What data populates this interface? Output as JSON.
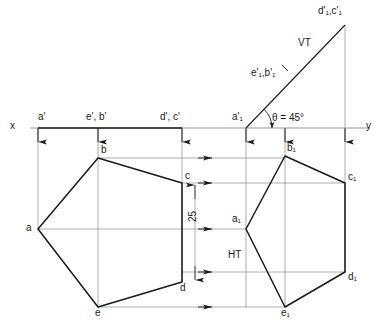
{
  "figure": {
    "type": "engineering-drawing",
    "line_color": "#1a1a1a",
    "thin_line_color": "#8a8a8a",
    "background": "#ffffff"
  },
  "axis": {
    "x_label": "x",
    "y_label": "y",
    "xy_line_y": 128,
    "x_start": 30,
    "x_end": 370
  },
  "front_view_labels": [
    {
      "id": "a-prime",
      "text": "a'",
      "x": 38,
      "y": 112
    },
    {
      "id": "e-b-prime",
      "text": "e', b'",
      "x": 86,
      "y": 112
    },
    {
      "id": "d-c-prime",
      "text": "d', c'",
      "x": 160,
      "y": 112
    },
    {
      "id": "a1-prime",
      "text": "a'₁",
      "x": 232,
      "y": 112
    }
  ],
  "tilted_view_labels": [
    {
      "id": "d1-c1-prime",
      "text": "d'₁,c'₁",
      "x": 318,
      "y": 6
    },
    {
      "id": "e1-b1-prime",
      "text": "e'₁,b'₁",
      "x": 251,
      "y": 68
    },
    {
      "id": "vt-label",
      "text": "VT",
      "x": 298,
      "y": 38
    },
    {
      "id": "angle-label",
      "text": "θ = 45°",
      "x": 272,
      "y": 113
    }
  ],
  "top_view_left": {
    "name": "pentagon-top-view-original",
    "vertices": [
      {
        "id": "a",
        "label": "a",
        "x": 38,
        "y": 229,
        "label_x": 26,
        "label_y": 223
      },
      {
        "id": "b",
        "label": "b",
        "x": 98,
        "y": 158,
        "label_x": 101,
        "label_y": 145
      },
      {
        "id": "c",
        "label": "c",
        "x": 182,
        "y": 183,
        "label_x": 185,
        "label_y": 171
      },
      {
        "id": "d",
        "label": "d",
        "x": 182,
        "y": 282,
        "label_x": 180,
        "label_y": 283
      },
      {
        "id": "e",
        "label": "e",
        "x": 98,
        "y": 307,
        "label_x": 95,
        "label_y": 308
      }
    ]
  },
  "top_view_right": {
    "name": "pentagon-top-view-rotated",
    "vertices": [
      {
        "id": "a1",
        "label": "a₁",
        "x": 246,
        "y": 229,
        "label_x": 232,
        "label_y": 214
      },
      {
        "id": "b1",
        "label": "b₁",
        "x": 285,
        "y": 156,
        "label_x": 287,
        "label_y": 143
      },
      {
        "id": "c1",
        "label": "c₁",
        "x": 345,
        "y": 183,
        "label_x": 348,
        "label_y": 172
      },
      {
        "id": "d1",
        "label": "d₁",
        "x": 345,
        "y": 272,
        "label_x": 348,
        "label_y": 272
      },
      {
        "id": "e1",
        "label": "e₁",
        "x": 285,
        "y": 307,
        "label_x": 281,
        "label_y": 308
      }
    ]
  },
  "dimension": {
    "name": "height-dimension",
    "value": "25",
    "x": 195,
    "y_top": 183,
    "y_bottom": 282,
    "label_x": 188,
    "label_y": 222
  },
  "trace_labels": {
    "ht": {
      "text": "HT",
      "x": 228,
      "y": 250
    },
    "vt": {
      "text": "VT"
    }
  },
  "vt_line": {
    "name": "vertical-trace-line",
    "x1": 246,
    "y1": 128,
    "x2": 345,
    "y2": 25,
    "angle_deg": 45,
    "intersection_point": {
      "x": 285,
      "y": 68
    }
  },
  "projector_verticals": [
    {
      "id": "proj-a",
      "x": 38,
      "y_from": 128,
      "y_to": 229
    },
    {
      "id": "proj-eb",
      "x": 98,
      "y_from": 128,
      "y_to": 307
    },
    {
      "id": "proj-dc",
      "x": 182,
      "y_from": 128,
      "y_to": 282
    },
    {
      "id": "proj-a1",
      "x": 246,
      "y_from": 128,
      "y_to": 307
    },
    {
      "id": "proj-e1b1",
      "x": 285,
      "y_from": 128,
      "y_to": 307
    },
    {
      "id": "proj-d1c1",
      "x": 345,
      "y_from": 25,
      "y_to": 272
    }
  ],
  "projector_horizontals": [
    {
      "id": "horiz-b",
      "y": 158,
      "x_from": 98,
      "x_to": 285
    },
    {
      "id": "horiz-c",
      "y": 183,
      "x_from": 182,
      "x_to": 345
    },
    {
      "id": "horiz-a",
      "y": 229,
      "x_from": 38,
      "x_to": 246
    },
    {
      "id": "horiz-d",
      "y": 272,
      "x_from": 182,
      "x_to": 345
    },
    {
      "id": "horiz-e",
      "y": 307,
      "x_from": 98,
      "x_to": 285
    }
  ]
}
